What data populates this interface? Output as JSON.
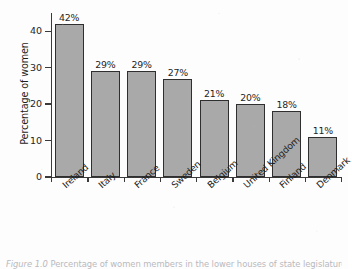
{
  "figure": {
    "background_color": "#fdfdfd",
    "bar_fill_color": "#a9a9a9",
    "bar_outline_color": "#2f2f2f",
    "axis_color": "#3a3a3a",
    "caption_prefix": "Figure 1.0",
    "caption_text": "Percentage of women members in the lower houses of state legislatures"
  },
  "chart_data": {
    "type": "bar",
    "title": "",
    "xlabel": "",
    "ylabel": "Percentage of women",
    "ylim": [
      0,
      45
    ],
    "yticks": [
      0,
      10,
      20,
      30,
      40
    ],
    "ytick_labels": [
      "0",
      "10",
      "20",
      "30",
      "40"
    ],
    "grid": false,
    "legend": false,
    "orientation": "vertical",
    "value_label_suffix": "%",
    "xtick_label_rotation": -42,
    "categories": [
      "Ireland",
      "Italy",
      "France",
      "Sweden",
      "Belgium",
      "United Kingdom",
      "Finland",
      "Denmark"
    ],
    "values": [
      42,
      29,
      29,
      27,
      21,
      20,
      18,
      11
    ],
    "value_labels": [
      "42%",
      "29%",
      "29%",
      "27%",
      "21%",
      "20%",
      "18%",
      "11%"
    ]
  }
}
